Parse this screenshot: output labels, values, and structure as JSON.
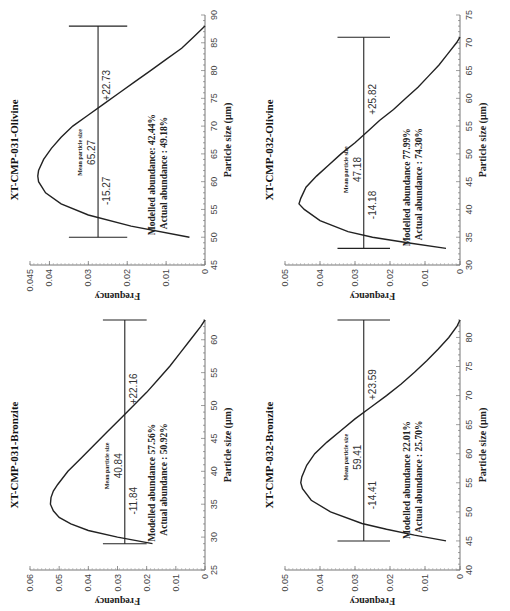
{
  "figure": {
    "orientation": "rotated-90-ccw",
    "line_color": "#222222",
    "background": "#ffffff"
  },
  "chart_data": [
    {
      "id": "xt-cmp-031-olivine",
      "position": "top-left",
      "type": "line",
      "title": "XT-CMP-031-Olivine",
      "xlabel": "Particle size (μm)",
      "ylabel": "Frequency",
      "xlim": [
        45,
        90
      ],
      "ylim": [
        0,
        0.045
      ],
      "xticks": [
        45,
        50,
        55,
        60,
        65,
        70,
        75,
        80,
        85,
        90
      ],
      "yticks": [
        0,
        0.01,
        0.02,
        0.03,
        0.04,
        0.045
      ],
      "ytick_labels": [
        "0",
        "0.01",
        "0.02",
        "0.03",
        "0.04",
        "0.045"
      ],
      "curve": {
        "x": [
          50,
          52,
          54,
          56,
          58,
          60,
          61,
          62,
          64,
          66,
          68,
          70,
          72,
          74,
          76,
          78,
          80,
          82,
          84,
          86,
          88
        ],
        "y": [
          0.004,
          0.019,
          0.03,
          0.037,
          0.041,
          0.0428,
          0.043,
          0.0428,
          0.0415,
          0.0395,
          0.037,
          0.034,
          0.03,
          0.026,
          0.022,
          0.018,
          0.014,
          0.01,
          0.006,
          0.003,
          0.0
        ]
      },
      "mean_bar": {
        "y": 0.0275,
        "x_min": 50.0,
        "x_max": 88.0,
        "mean": 65.27,
        "cap_halfheight": 0.0075
      },
      "annotations": {
        "mean_label": "Mean particle size",
        "mean_value": "65.27",
        "minus": "-15.27",
        "plus": "+22.73",
        "modelled": "Modelled abundance:  42.44%",
        "actual": "Actual abundance  :  49.18%"
      }
    },
    {
      "id": "xt-cmp-032-olivine",
      "position": "top-right",
      "type": "line",
      "title": "XT-CMP-032-Olivine",
      "xlabel": "Particle size (μm)",
      "ylabel": "Frequency",
      "xlim": [
        30,
        75
      ],
      "ylim": [
        0,
        0.05
      ],
      "xticks": [
        30,
        35,
        40,
        45,
        50,
        55,
        60,
        65,
        70,
        75
      ],
      "yticks": [
        0,
        0.01,
        0.02,
        0.03,
        0.04,
        0.05
      ],
      "ytick_labels": [
        "0",
        "0.01",
        "0.02",
        "0.03",
        "0.04",
        "0.05"
      ],
      "curve": {
        "x": [
          33,
          34,
          35,
          36,
          38,
          40,
          41,
          42,
          44,
          46,
          48,
          50,
          52,
          54,
          56,
          58,
          60,
          62,
          64,
          66,
          68,
          70,
          71
        ],
        "y": [
          0.004,
          0.015,
          0.025,
          0.032,
          0.04,
          0.0445,
          0.046,
          0.0455,
          0.044,
          0.041,
          0.0375,
          0.034,
          0.03,
          0.0265,
          0.023,
          0.019,
          0.0155,
          0.012,
          0.009,
          0.006,
          0.0035,
          0.001,
          0.0
        ]
      },
      "mean_bar": {
        "y": 0.0275,
        "x_min": 33.0,
        "x_max": 71.0,
        "mean": 47.18,
        "cap_halfheight": 0.0075
      },
      "annotations": {
        "mean_label": "Mean particle size",
        "mean_value": "47.18",
        "minus": "-14.18",
        "plus": "+25.82",
        "modelled": "Modelled abundance   77.99%",
        "actual": "Actual abundance  :  74.30%"
      }
    },
    {
      "id": "xt-cmp-031-bronzite",
      "position": "bottom-left",
      "type": "line",
      "title": "XT-CMP-031-Bronzite",
      "xlabel": "Particle size (μm)",
      "ylabel": "Frequency",
      "xlim": [
        25,
        63
      ],
      "ylim": [
        0,
        0.06
      ],
      "xticks": [
        25,
        30,
        35,
        40,
        45,
        50,
        55,
        60
      ],
      "yticks": [
        0,
        0.01,
        0.02,
        0.03,
        0.04,
        0.05,
        0.06
      ],
      "ytick_labels": [
        "0",
        "0.01",
        "0.02",
        "0.03",
        "0.04",
        "0.05",
        "0.06"
      ],
      "curve": {
        "x": [
          29,
          30,
          31,
          32,
          33,
          34,
          35,
          36,
          37,
          38,
          40,
          42,
          44,
          46,
          48,
          50,
          52,
          54,
          56,
          58,
          60,
          62,
          63
        ],
        "y": [
          0.018,
          0.03,
          0.04,
          0.046,
          0.05,
          0.052,
          0.053,
          0.0528,
          0.052,
          0.0505,
          0.047,
          0.0425,
          0.038,
          0.0335,
          0.029,
          0.0245,
          0.02,
          0.016,
          0.012,
          0.0085,
          0.005,
          0.0015,
          0.0
        ]
      },
      "mean_bar": {
        "y": 0.0275,
        "x_min": 29.0,
        "x_max": 63.0,
        "mean": 40.84,
        "cap_halfheight": 0.0075
      },
      "annotations": {
        "mean_label": "Mean particle size",
        "mean_value": "40.84",
        "minus": "-11.84",
        "plus": "+22.16",
        "modelled": "Modelled abundance   57.56%",
        "actual": "Actual abundance  :  50.92%"
      }
    },
    {
      "id": "xt-cmp-032-bronzite",
      "position": "bottom-right",
      "type": "line",
      "title": "XT-CMP-032-Bronzite",
      "xlabel": "Particle size (μm)",
      "ylabel": "Frequency",
      "xlim": [
        40,
        83
      ],
      "ylim": [
        0,
        0.05
      ],
      "xticks": [
        40,
        45,
        50,
        55,
        60,
        65,
        70,
        75,
        80
      ],
      "yticks": [
        0,
        0.01,
        0.02,
        0.03,
        0.04,
        0.05
      ],
      "ytick_labels": [
        "0",
        "0.01",
        "0.02",
        "0.03",
        "0.04",
        "0.05"
      ],
      "curve": {
        "x": [
          45,
          46,
          47,
          48,
          50,
          52,
          54,
          55,
          56,
          58,
          60,
          62,
          64,
          66,
          68,
          70,
          72,
          74,
          76,
          78,
          80,
          82,
          83
        ],
        "y": [
          0.004,
          0.013,
          0.021,
          0.028,
          0.037,
          0.0425,
          0.045,
          0.0455,
          0.0452,
          0.0438,
          0.0415,
          0.038,
          0.034,
          0.03,
          0.0255,
          0.021,
          0.0168,
          0.013,
          0.0095,
          0.0062,
          0.0032,
          0.0008,
          0.0
        ]
      },
      "mean_bar": {
        "y": 0.0275,
        "x_min": 45.0,
        "x_max": 83.0,
        "mean": 59.41,
        "cap_halfheight": 0.0075
      },
      "annotations": {
        "mean_label": "Mean particle size",
        "mean_value": "59.41",
        "minus": "-14.41",
        "plus": "+23.59",
        "modelled": "Modelled abundance   22.01%",
        "actual": "Actual abundance  :  25.70%"
      }
    }
  ]
}
